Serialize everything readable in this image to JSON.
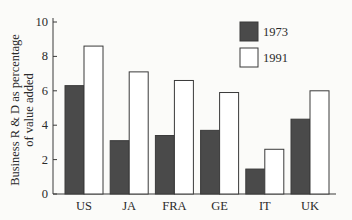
{
  "chart_data": {
    "type": "bar",
    "title": "",
    "xlabel": "",
    "ylabel": "Business R & D as percentage of value added",
    "ylabel_lines": [
      "Business R & D as percentage",
      "of value added"
    ],
    "categories": [
      "US",
      "JA",
      "FRA",
      "GE",
      "IT",
      "UK"
    ],
    "series": [
      {
        "name": "1973",
        "color": "#4a4a4a",
        "values": [
          6.3,
          3.1,
          3.4,
          3.7,
          1.45,
          4.35
        ]
      },
      {
        "name": "1991",
        "color": "#ffffff",
        "values": [
          8.6,
          7.1,
          6.6,
          5.9,
          2.6,
          6.0
        ]
      }
    ],
    "yticks": [
      0,
      2,
      4,
      6,
      8,
      10
    ],
    "ylim": [
      0,
      10
    ],
    "grid": false,
    "legend_position": "top-right"
  },
  "legend": {
    "items": [
      {
        "label": "1973",
        "color": "#4a4a4a"
      },
      {
        "label": "1991",
        "color": "#ffffff"
      }
    ]
  }
}
